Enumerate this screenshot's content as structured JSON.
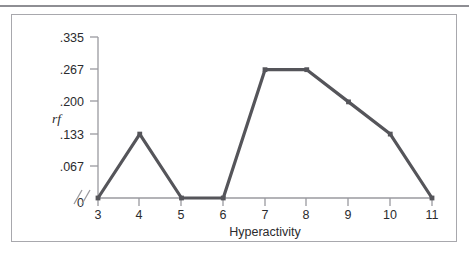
{
  "figure": {
    "has_top_rule": true,
    "has_frame_border": true,
    "frame_color": "#a8a8ad",
    "rule_color": "#8e8e93"
  },
  "chart_data": {
    "type": "line",
    "title": "",
    "subtitle": "",
    "xlabel": "Hyperactivity",
    "ylabel": "rf",
    "x": [
      3,
      4,
      5,
      6,
      7,
      8,
      9,
      10,
      11
    ],
    "values": [
      0,
      0.133,
      0,
      0,
      0.267,
      0.267,
      0.2,
      0.133,
      0
    ],
    "series": [
      {
        "name": "rf",
        "values": [
          0,
          0.133,
          0,
          0,
          0.267,
          0.267,
          0.2,
          0.133,
          0
        ]
      }
    ],
    "xtick_labels": [
      "3",
      "4",
      "5",
      "6",
      "7",
      "8",
      "9",
      "10",
      "11"
    ],
    "ytick_labels": [
      "0",
      ".067",
      ".133",
      ".200",
      ".267",
      ".335"
    ],
    "ytick_values": [
      0,
      0.067,
      0.133,
      0.2,
      0.267,
      0.335
    ],
    "xlim": [
      3,
      11
    ],
    "ylim": [
      0,
      0.335
    ],
    "grid": false,
    "legend": false,
    "legend_position": "none",
    "x_axis_break": true,
    "x_axis_break_label": "//",
    "x_origin_label": "0",
    "line_color": "#55555a",
    "marker": "square",
    "marker_color": "#55555a",
    "axis_color": "#9a9a9f"
  }
}
